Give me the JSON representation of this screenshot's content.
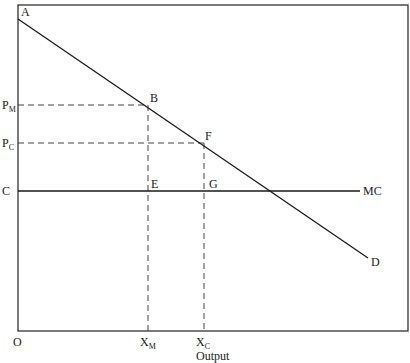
{
  "diagram": {
    "title": "",
    "frame": {
      "left": 18,
      "top": 5,
      "right": 408,
      "bottom": 331
    },
    "axis": {
      "origin_label": "O",
      "x_axis_label": "Output"
    },
    "demand_curve": {
      "label_start": "A",
      "label_end": "D",
      "start": [
        18,
        19
      ],
      "end": [
        368,
        258
      ]
    },
    "mc_line": {
      "left_label": "C",
      "right_label": "MC",
      "y": 191,
      "x_end": 360
    },
    "points": {
      "B": {
        "label": "B",
        "x": 148,
        "y": 105
      },
      "F": {
        "label": "F",
        "x": 204,
        "y": 143
      },
      "E": {
        "label": "E",
        "x": 148,
        "y": 191
      },
      "G": {
        "label": "G",
        "x": 204,
        "y": 191
      }
    },
    "price_labels": {
      "PM": {
        "main": "P",
        "sub": "M"
      },
      "PC": {
        "main": "P",
        "sub": "C"
      }
    },
    "quantity_labels": {
      "XM": {
        "main": "X",
        "sub": "M"
      },
      "XC": {
        "main": "X",
        "sub": "C"
      }
    },
    "colors": {
      "line": "#1a1a1a",
      "frame": "#333333",
      "dash": "#444444"
    }
  }
}
